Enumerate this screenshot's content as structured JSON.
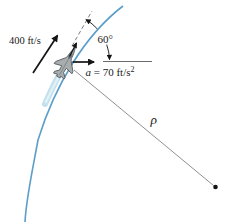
{
  "figure": {
    "velocity_label": "400 ft/s",
    "angle_label": "60°",
    "accel_var": "a",
    "accel_rest": " = 70 ft/s",
    "accel_sup": "2",
    "radius_label": "ρ"
  },
  "colors": {
    "path_blue": "#5b9ec9",
    "contrail_outer": "#b5d8e9",
    "contrail_inner": "#e2f1f8",
    "ink": "#141414",
    "gray_line": "#909090",
    "dash_line": "#7d7d7d",
    "jet_body": "#a8adb0",
    "jet_outline": "#54585b",
    "jet_canopy": "#6f7578"
  }
}
